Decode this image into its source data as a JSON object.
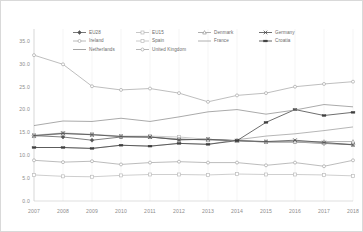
{
  "chart_data": {
    "type": "line",
    "title": "",
    "xlabel": "",
    "ylabel": "",
    "categories": [
      "2007",
      "2008",
      "2009",
      "2010",
      "2011",
      "2012",
      "2013",
      "2014",
      "2015",
      "2016",
      "2017",
      "2018"
    ],
    "ylim": [
      0.0,
      35.0
    ],
    "yticks": [
      "0.0",
      "5.0",
      "10.0",
      "15.0",
      "20.0",
      "25.0",
      "30.0",
      "35.0"
    ],
    "ytick_values": [
      0.0,
      5.0,
      10.0,
      15.0,
      20.0,
      25.0,
      30.0,
      35.0
    ],
    "grid": "vertical",
    "legend_position": "top",
    "series": [
      {
        "name": "EU28",
        "color": "#555555",
        "marker": "diamond",
        "values": [
          14.3,
          14.0,
          13.3,
          14.0,
          14.0,
          13.4,
          13.5,
          13.2,
          12.9,
          12.9,
          12.6,
          12.3
        ]
      },
      {
        "name": "EU15",
        "color": "#b9b9b9",
        "marker": "square",
        "values": [
          14.4,
          14.9,
          14.6,
          14.2,
          14.2,
          14.0,
          13.5,
          13.2,
          12.9,
          12.9,
          12.7,
          12.4
        ]
      },
      {
        "name": "Denmark",
        "color": "#9a9a9a",
        "marker": "triangle",
        "values": [
          14.2,
          14.7,
          14.5,
          14.1,
          14.0,
          13.6,
          13.3,
          13.2,
          13.0,
          13.0,
          13.0,
          13.0
        ]
      },
      {
        "name": "Germany",
        "color": "#4a4a4a",
        "marker": "cross",
        "values": [
          14.3,
          14.8,
          14.5,
          14.1,
          14.0,
          13.4,
          13.5,
          13.2,
          13.0,
          13.3,
          12.8,
          12.3
        ]
      },
      {
        "name": "Ireland",
        "color": "#a8a8a8",
        "marker": "circle",
        "values": [
          31.9,
          29.9,
          25.1,
          24.3,
          24.6,
          23.6,
          21.7,
          23.1,
          23.6,
          25.0,
          25.6,
          26.1
        ]
      },
      {
        "name": "Spain",
        "color": "#bdbdbd",
        "marker": "square",
        "values": [
          5.7,
          5.4,
          5.3,
          5.6,
          5.8,
          5.8,
          5.7,
          5.9,
          5.8,
          5.8,
          5.7,
          5.5
        ]
      },
      {
        "name": "France",
        "color": "#9d9d9d",
        "marker": "line",
        "values": [
          11.7,
          11.7,
          11.5,
          12.2,
          12.0,
          12.6,
          12.4,
          13.4,
          14.2,
          14.7,
          15.4,
          16.2
        ]
      },
      {
        "name": "Croatia",
        "color": "#3d3d3d",
        "marker": "bar",
        "values": [
          11.7,
          11.7,
          11.5,
          12.2,
          12.0,
          12.6,
          12.4,
          13.2,
          17.2,
          20.0,
          18.7,
          19.4
        ]
      },
      {
        "name": "Netherlands",
        "color": "#8e8e8e",
        "marker": "none",
        "values": [
          16.5,
          17.5,
          17.4,
          18.1,
          17.4,
          18.4,
          19.5,
          20.0,
          19.0,
          19.9,
          21.1,
          20.6
        ]
      },
      {
        "name": "United Kingdom",
        "color": "#a5a5a5",
        "marker": "circle",
        "values": [
          8.9,
          8.5,
          8.7,
          8.0,
          8.4,
          8.6,
          8.4,
          8.4,
          7.8,
          8.4,
          7.6,
          8.9
        ]
      }
    ]
  },
  "legend": {
    "rows": [
      [
        "EU28",
        "EU15",
        "Denmark",
        "Germany"
      ],
      [
        "Ireland",
        "Spain",
        "France",
        "Croatia"
      ],
      [
        "Netherlands",
        "United Kingdom"
      ]
    ]
  }
}
